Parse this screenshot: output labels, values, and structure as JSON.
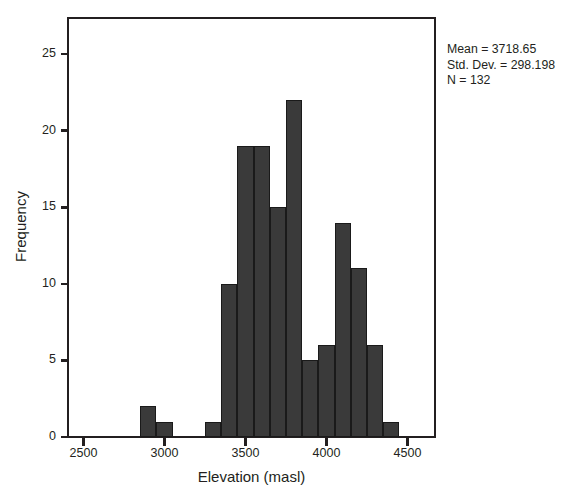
{
  "chart_data": {
    "type": "bar",
    "title": "",
    "subtitle": "",
    "xlabel": "Elevation (masl)",
    "ylabel": "Frequency",
    "xlim": [
      2400,
      4600
    ],
    "ylim": [
      0,
      26.5
    ],
    "xticks": [
      2500,
      3000,
      3500,
      4000,
      4500
    ],
    "xtick_labels": [
      "2500",
      "3000",
      "3500",
      "4000",
      "4500"
    ],
    "yticks": [
      0,
      5,
      10,
      15,
      20,
      25
    ],
    "ytick_labels": [
      "0",
      "5",
      "10",
      "15",
      "20",
      "25"
    ],
    "grid": false,
    "legend": null,
    "bin_width": 100,
    "bar_color": "#3a3a3a",
    "bar_edge_color": "#1a1a1a",
    "bins": [
      {
        "start": 2850,
        "end": 2950,
        "center": 2900,
        "value": 2
      },
      {
        "start": 2950,
        "end": 3050,
        "center": 3000,
        "value": 1
      },
      {
        "start": 3250,
        "end": 3350,
        "center": 3300,
        "value": 1
      },
      {
        "start": 3350,
        "end": 3450,
        "center": 3400,
        "value": 10
      },
      {
        "start": 3450,
        "end": 3550,
        "center": 3500,
        "value": 19
      },
      {
        "start": 3550,
        "end": 3650,
        "center": 3600,
        "value": 19
      },
      {
        "start": 3650,
        "end": 3750,
        "center": 3700,
        "value": 15
      },
      {
        "start": 3750,
        "end": 3850,
        "center": 3800,
        "value": 22
      },
      {
        "start": 3850,
        "end": 3950,
        "center": 3900,
        "value": 5
      },
      {
        "start": 3950,
        "end": 4050,
        "center": 4000,
        "value": 6
      },
      {
        "start": 4050,
        "end": 4150,
        "center": 4100,
        "value": 14
      },
      {
        "start": 4150,
        "end": 4250,
        "center": 4200,
        "value": 11
      },
      {
        "start": 4250,
        "end": 4350,
        "center": 4300,
        "value": 6
      },
      {
        "start": 4350,
        "end": 4450,
        "center": 4400,
        "value": 1
      }
    ],
    "categories": [
      "2900",
      "3000",
      "3300",
      "3400",
      "3500",
      "3600",
      "3700",
      "3800",
      "3900",
      "4000",
      "4100",
      "4200",
      "4300",
      "4400"
    ],
    "values": [
      2,
      1,
      1,
      10,
      19,
      19,
      15,
      22,
      5,
      6,
      14,
      11,
      6,
      1
    ],
    "annotations": {
      "mean_label": "Mean = 3718.65",
      "stddev_label": "Std. Dev. = 298.198",
      "n_label": "N = 132",
      "mean": 3718.65,
      "std_dev": 298.198,
      "n": 132
    }
  },
  "axes": {
    "x_title": "Elevation (masl)",
    "y_title": "Frequency",
    "x_tick_labels": [
      "2500",
      "3000",
      "3500",
      "4000",
      "4500"
    ],
    "y_tick_labels": [
      "0",
      "5",
      "10",
      "15",
      "20",
      "25"
    ]
  },
  "stats": {
    "mean_label": "Mean = 3718.65",
    "stddev_label": "Std. Dev. = 298.198",
    "n_label": "N = 132"
  }
}
